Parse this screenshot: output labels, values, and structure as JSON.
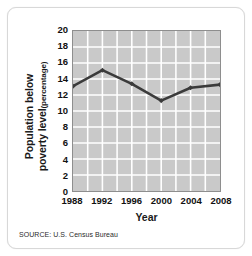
{
  "figure": {
    "y_axis_title_main": "Population below",
    "y_axis_title_main2": "poverty level",
    "y_axis_title_unit": "(percentage)",
    "x_axis_title": "Year",
    "source_note": "SOURCE: U.S. Census Bureau",
    "plot_bg_color": "#c9c9c9",
    "grid_color": "#ffffff",
    "line_color": "#3b3b3b",
    "marker_color": "#3b3b3b",
    "frame_color": "#8e8e8e"
  },
  "chart_data": {
    "type": "line",
    "title": "",
    "subtitle": "",
    "xlabel": "Year",
    "ylabel": "Population below poverty level (percentage)",
    "x": [
      1988,
      1992,
      1996,
      2000,
      2004,
      2008
    ],
    "values": [
      13.1,
      15.1,
      13.4,
      11.3,
      12.9,
      13.3
    ],
    "xtick_labels": [
      "1988",
      "1992",
      "1996",
      "2000",
      "2004",
      "2008"
    ],
    "ytick_labels": [
      "0",
      "2",
      "4",
      "6",
      "8",
      "10",
      "12",
      "14",
      "16",
      "18",
      "20"
    ],
    "yticks": [
      0,
      2,
      4,
      6,
      8,
      10,
      12,
      14,
      16,
      18,
      20
    ],
    "xlim": [
      1988,
      2008
    ],
    "ylim": [
      0,
      20
    ],
    "grid": true,
    "legend": false,
    "legend_position": "none",
    "source": "SOURCE: U.S. Census Bureau",
    "series": [
      {
        "name": "Population below poverty level",
        "values": [
          13.1,
          15.1,
          13.4,
          11.3,
          12.9,
          13.3
        ]
      }
    ]
  }
}
